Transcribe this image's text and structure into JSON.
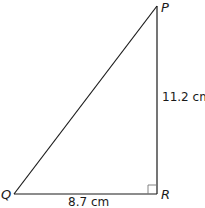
{
  "diagram": {
    "type": "right-triangle",
    "vertices": {
      "P": {
        "label": "P"
      },
      "Q": {
        "label": "Q"
      },
      "R": {
        "label": "R"
      }
    },
    "sides": {
      "PR": {
        "length_label": "11.2 cm"
      },
      "QR": {
        "length_label": "8.7 cm"
      },
      "PQ": {
        "length_label": ""
      }
    },
    "right_angle_at": "R",
    "colors": {
      "stroke": "#1a1a1a",
      "background": "#ffffff"
    }
  }
}
